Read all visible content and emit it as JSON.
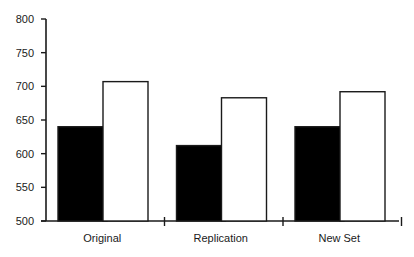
{
  "chart_data": {
    "type": "bar",
    "title": "",
    "xlabel": "",
    "ylabel": "",
    "categories": [
      "Original",
      "Replication",
      "New Set"
    ],
    "series": [
      {
        "name": "Series 1 (black)",
        "color": "#000000",
        "values": [
          640,
          612,
          640
        ]
      },
      {
        "name": "Series 2 (white)",
        "color": "#ffffff",
        "values": [
          707,
          683,
          692
        ]
      }
    ],
    "ylim": [
      500,
      800
    ],
    "yticks": [
      500,
      550,
      600,
      650,
      700,
      750,
      800
    ],
    "grid": false,
    "legend": null
  },
  "colors": {
    "axis": "#1a1a1a",
    "bar_outline": "#1a1a1a",
    "background": "#ffffff"
  }
}
